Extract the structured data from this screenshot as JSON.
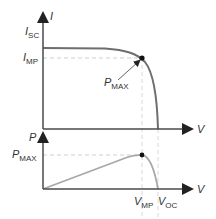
{
  "diagram": {
    "iv_plot": {
      "y_axis_label": "I",
      "x_axis_label": "V",
      "isc_label": {
        "main": "I",
        "sub": "SC"
      },
      "imp_label": {
        "main": "I",
        "sub": "MP"
      },
      "pmax_label": {
        "main": "P",
        "sub": "MAX"
      }
    },
    "pv_plot": {
      "y_axis_label": "P",
      "x_axis_label": "V",
      "pmax_label": {
        "main": "P",
        "sub": "MAX"
      },
      "vmp_label": {
        "main": "V",
        "sub": "MP"
      },
      "voc_label": {
        "main": "V",
        "sub": "OC"
      }
    },
    "colors": {
      "axis": "#4a4a4a",
      "iv_curve": "#6e6e6e",
      "pv_curve": "#a8a8a8",
      "guide": "#cfcfcf",
      "point": "#111111"
    }
  }
}
